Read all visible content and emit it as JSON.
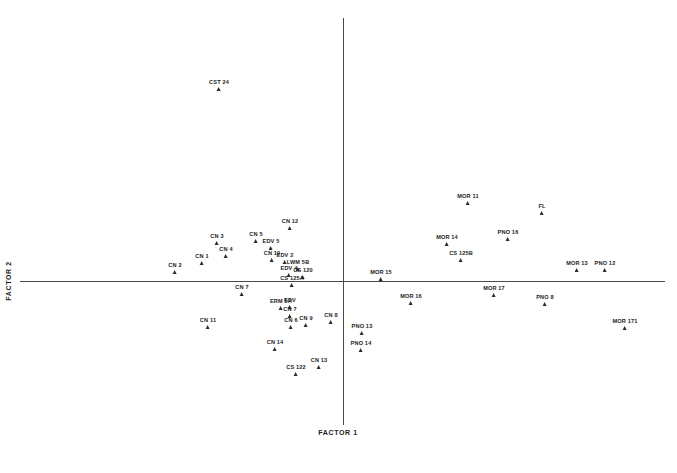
{
  "chart_data": {
    "type": "scatter",
    "title": "",
    "xlabel": "FACTOR 1",
    "ylabel": "FACTOR 2",
    "grid": false,
    "legend": "none",
    "axes": {
      "origin_px": {
        "x": 343,
        "y": 281
      },
      "x_axis_span_px": {
        "x1": 20,
        "x2": 665,
        "y": 281
      },
      "y_axis_span_px": {
        "y1": 18,
        "y2": 425,
        "x": 343
      }
    },
    "marker": {
      "shape": "triangle-up",
      "color": "#2b2b2b",
      "size_px": 5
    },
    "point_count": 44,
    "points": [
      {
        "label": "CST 24",
        "px": 219,
        "py": 91
      },
      {
        "label": "CN 2",
        "px": 175,
        "py": 274
      },
      {
        "label": "CN 1",
        "px": 202,
        "py": 265
      },
      {
        "label": "CN 4",
        "px": 226,
        "py": 258
      },
      {
        "label": "CN 3",
        "px": 217,
        "py": 245
      },
      {
        "label": "CN 5",
        "px": 256,
        "py": 243
      },
      {
        "label": "EDV 5",
        "px": 271,
        "py": 250
      },
      {
        "label": "CN 12",
        "px": 290,
        "py": 230
      },
      {
        "label": "CN 10",
        "px": 272,
        "py": 262
      },
      {
        "label": "EDV 2",
        "px": 285,
        "py": 264
      },
      {
        "label": "LWM 5B",
        "px": 298,
        "py": 271
      },
      {
        "label": "EDV 4",
        "px": 289,
        "py": 277
      },
      {
        "label": "CS 120",
        "px": 303,
        "py": 279
      },
      {
        "label": "CS 125A",
        "px": 292,
        "py": 287
      },
      {
        "label": "CN 7",
        "px": 242,
        "py": 296
      },
      {
        "label": "ERM 5A",
        "px": 281,
        "py": 310
      },
      {
        "label": "EDV",
        "px": 290,
        "py": 309
      },
      {
        "label": "CN 7",
        "px": 290,
        "py": 318
      },
      {
        "label": "CN 6",
        "px": 291,
        "py": 329
      },
      {
        "label": "CN 9",
        "px": 306,
        "py": 327
      },
      {
        "label": "CN 8",
        "px": 331,
        "py": 324
      },
      {
        "label": "CN 11",
        "px": 208,
        "py": 329
      },
      {
        "label": "CN 14",
        "px": 275,
        "py": 351
      },
      {
        "label": "CS 122",
        "px": 296,
        "py": 376
      },
      {
        "label": "CN 13",
        "px": 319,
        "py": 369
      },
      {
        "label": "PNO 13",
        "px": 362,
        "py": 335
      },
      {
        "label": "PNO 14",
        "px": 361,
        "py": 352
      },
      {
        "label": "MOR 15",
        "px": 381,
        "py": 281
      },
      {
        "label": "MOR 16",
        "px": 411,
        "py": 305
      },
      {
        "label": "MOR 14",
        "px": 447,
        "py": 246
      },
      {
        "label": "CS 125B",
        "px": 461,
        "py": 262
      },
      {
        "label": "MOR 11",
        "px": 468,
        "py": 205
      },
      {
        "label": "MOR 17",
        "px": 494,
        "py": 297
      },
      {
        "label": "FL",
        "px": 542,
        "py": 215
      },
      {
        "label": "PNO 16",
        "px": 508,
        "py": 241
      },
      {
        "label": "MOR 13",
        "px": 577,
        "py": 272
      },
      {
        "label": "PNO 12",
        "px": 605,
        "py": 272
      },
      {
        "label": "PNO 8",
        "px": 545,
        "py": 306
      },
      {
        "label": "MOR 171",
        "px": 625,
        "py": 330
      }
    ]
  },
  "axis": {
    "x_title": "FACTOR 1",
    "y_title": "FACTOR 2"
  },
  "caption": ""
}
